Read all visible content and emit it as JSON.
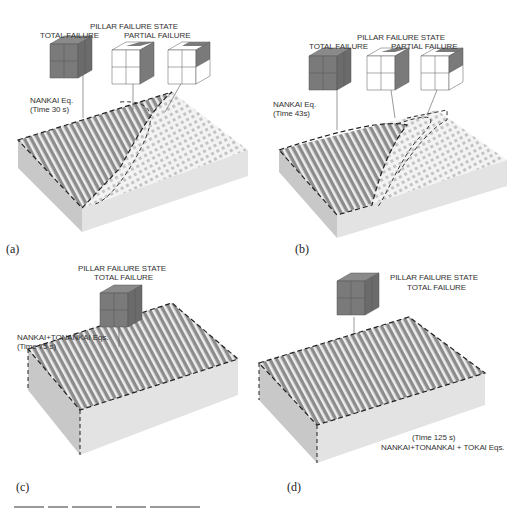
{
  "panels": [
    {
      "id": "a",
      "letter": "(a)",
      "heading": "PILLAR FAILURE  STATE",
      "states": [
        "TOTAL FAILURE",
        "PARTIAL FAILURE"
      ],
      "event": "NANKAI Eq.",
      "time": "(Time 30 s)",
      "cubes": [
        "total",
        "partial-side",
        "partial-corner"
      ]
    },
    {
      "id": "b",
      "letter": "(b)",
      "heading": "PILLAR FAILURE  STATE",
      "states": [
        "TOTAL FAILURE",
        "PARTIAL FAILURE"
      ],
      "event": "NANKAI Eq.",
      "time": "(Time 43s)",
      "cubes": [
        "total",
        "partial-side",
        "partial-corner"
      ]
    },
    {
      "id": "c",
      "letter": "(c)",
      "heading": "PILLAR FAILURE  STATE",
      "states": [
        "TOTAL FAILURE"
      ],
      "event": "NANKAI+TONANKAI Eqs.",
      "time": "(Time 75 s)",
      "cubes": [
        "total"
      ]
    },
    {
      "id": "d",
      "letter": "(d)",
      "heading": "PILLAR FAILURE  STATE",
      "states": [
        "TOTAL FAILURE"
      ],
      "event": "NANKAI+TONANKAI + TOKAI Eqs.",
      "time": "(Time 125 s)",
      "cubes": [
        "total"
      ]
    }
  ],
  "colors": {
    "failed": "#7a7a7a",
    "intact": "#ffffff",
    "block_side": "#d9d9d9",
    "block_front": "#e6e6e6",
    "dashed_boundary": "#222222"
  },
  "caption": "Figure 3.16 ..."
}
